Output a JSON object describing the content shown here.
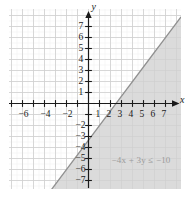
{
  "figure": {
    "title": "",
    "x_axis_label": "x",
    "y_axis_label": "y",
    "annotation": "−4x + 3y ≤ −10"
  },
  "chart_data": {
    "type": "line",
    "title": "",
    "xlabel": "x",
    "ylabel": "y",
    "xlim": [
      -7.5,
      7.8
    ],
    "ylim": [
      -7.8,
      7.8
    ],
    "grid": true,
    "legend": null,
    "x_ticks": [
      -7,
      -6,
      -5,
      -4,
      -3,
      -2,
      -1,
      1,
      2,
      3,
      4,
      5,
      6,
      7
    ],
    "x_tick_labels": [
      "",
      "−6",
      "",
      "−4",
      "",
      "−2",
      "",
      "1",
      "2",
      "3",
      "4",
      "5",
      "6",
      "7"
    ],
    "y_ticks": [
      -7,
      -6,
      -5,
      -4,
      -3,
      -2,
      -1,
      1,
      2,
      3,
      4,
      5,
      6,
      7
    ],
    "y_tick_labels": [
      "−7",
      "−6",
      "−5",
      "−4",
      "−3",
      "−2",
      "",
      "1",
      "2",
      "3",
      "4",
      "5",
      "6",
      "7"
    ],
    "series": [
      {
        "name": "boundary line",
        "equation": "-4x + 3y = -10",
        "slope": 1.3333,
        "intercept": -3.3333,
        "style": "solid",
        "color": "#888888"
      }
    ],
    "shaded_region": {
      "inequality": "-4x + 3y <= -10",
      "side": "below-right",
      "color": "#d9d9d9",
      "boundary_included": true
    },
    "annotations": [
      {
        "text": "−4x + 3y ≤ −10",
        "x": 3.2,
        "y": -5.2,
        "color": "#9a9a9a"
      }
    ]
  },
  "ticks": {
    "x": [
      {
        "v": -6,
        "label": "−6"
      },
      {
        "v": -4,
        "label": "−4"
      },
      {
        "v": -2,
        "label": "−2"
      },
      {
        "v": 1,
        "label": "1"
      },
      {
        "v": 2,
        "label": "2"
      },
      {
        "v": 3,
        "label": "3"
      },
      {
        "v": 4,
        "label": "4"
      },
      {
        "v": 5,
        "label": "5"
      },
      {
        "v": 6,
        "label": "6"
      },
      {
        "v": 7,
        "label": "7"
      }
    ],
    "y": [
      {
        "v": 7,
        "label": "7"
      },
      {
        "v": 6,
        "label": "6"
      },
      {
        "v": 5,
        "label": "5"
      },
      {
        "v": 4,
        "label": "4"
      },
      {
        "v": 3,
        "label": "3"
      },
      {
        "v": 2,
        "label": "2"
      },
      {
        "v": 1,
        "label": "1"
      },
      {
        "v": -2,
        "label": "−2"
      },
      {
        "v": -3,
        "label": "−3"
      },
      {
        "v": -4,
        "label": "−4"
      },
      {
        "v": -5,
        "label": "−5"
      },
      {
        "v": -6,
        "label": "−6"
      },
      {
        "v": -7,
        "label": "−7"
      }
    ]
  },
  "colors": {
    "grid_minor": "#ececec",
    "grid_major": "#e0e0e0",
    "axis": "#1a1a1a",
    "shade": "#d9d9d9",
    "line": "#8f8f8f",
    "annotation": "#9a9a9a"
  }
}
